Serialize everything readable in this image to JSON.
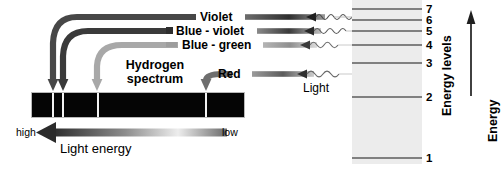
{
  "diagram": {
    "title_block": "Hydrogen\nspectrum",
    "title_line1": "Hydrogen",
    "title_line2": "spectrum",
    "light_label": "Light",
    "energy_levels_caption": "Energy levels",
    "energy_caption": "Energy",
    "light_energy_caption": "Light energy",
    "energy_high_label": "high",
    "energy_low_label": "low"
  },
  "spectral_lines": [
    {
      "name": "violet",
      "label": "Violet",
      "band_x": 52,
      "row_y": 17,
      "color": "#4a4a4a",
      "level_from": 6,
      "level_to": 2
    },
    {
      "name": "blue-violet",
      "label": "Blue - violet",
      "band_x": 62,
      "row_y": 31,
      "color": "#3d3d3d",
      "level_from": 5,
      "level_to": 2
    },
    {
      "name": "blue-green",
      "label": "Blue - green",
      "band_x": 97,
      "row_y": 45,
      "color": "#a8a8a8",
      "level_from": 4,
      "level_to": 2
    },
    {
      "name": "red",
      "label": "Red",
      "band_x": 205,
      "row_y": 74,
      "color": "#6e6e6e",
      "level_from": 3,
      "level_to": 2
    }
  ],
  "spectrum_band": {
    "name": "hydrogen-emission-spectrum",
    "background": "#050505",
    "line_color": "#f2f2f2",
    "line_positions": [
      52,
      62,
      97,
      205
    ]
  },
  "energy_levels": {
    "numbers": [
      "7",
      "6",
      "5",
      "4",
      "3",
      "2",
      "1"
    ],
    "level_7": "7",
    "level_6": "6",
    "level_5": "5",
    "level_4": "4",
    "level_3": "3",
    "level_2": "2",
    "level_1": "1",
    "transitions_end_level": "2",
    "panel_color": "#ececec"
  },
  "colors": {
    "band": "#050505",
    "panel": "#ececec",
    "ink": "#000000",
    "rule": "#5c5c5c"
  }
}
